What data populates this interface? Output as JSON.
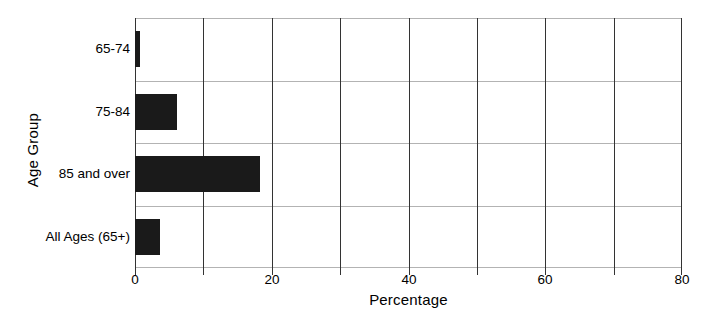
{
  "chart_data": {
    "type": "bar",
    "orientation": "horizontal",
    "title": "",
    "xlabel": "Percentage",
    "ylabel": "Age Group",
    "categories": [
      "65-74",
      "75-84",
      "85 and over",
      "All Ages (65+)"
    ],
    "values": [
      0.8,
      6.1,
      18.3,
      3.7
    ],
    "xlim": [
      0,
      80
    ],
    "xticks": [
      0,
      10,
      20,
      30,
      40,
      50,
      60,
      70,
      80
    ],
    "xticklabels": [
      "0",
      "",
      "20",
      "",
      "40",
      "",
      "60",
      "",
      "80"
    ],
    "labeled_xticks": [
      0,
      20,
      40,
      60,
      80
    ],
    "grid": {
      "vertical": true,
      "horizontal": true,
      "vertical_color": "#333333",
      "horizontal_color": "#b3b3b3"
    },
    "legend": null,
    "bar_color": "#1a1a1a",
    "background": "#ffffff"
  }
}
